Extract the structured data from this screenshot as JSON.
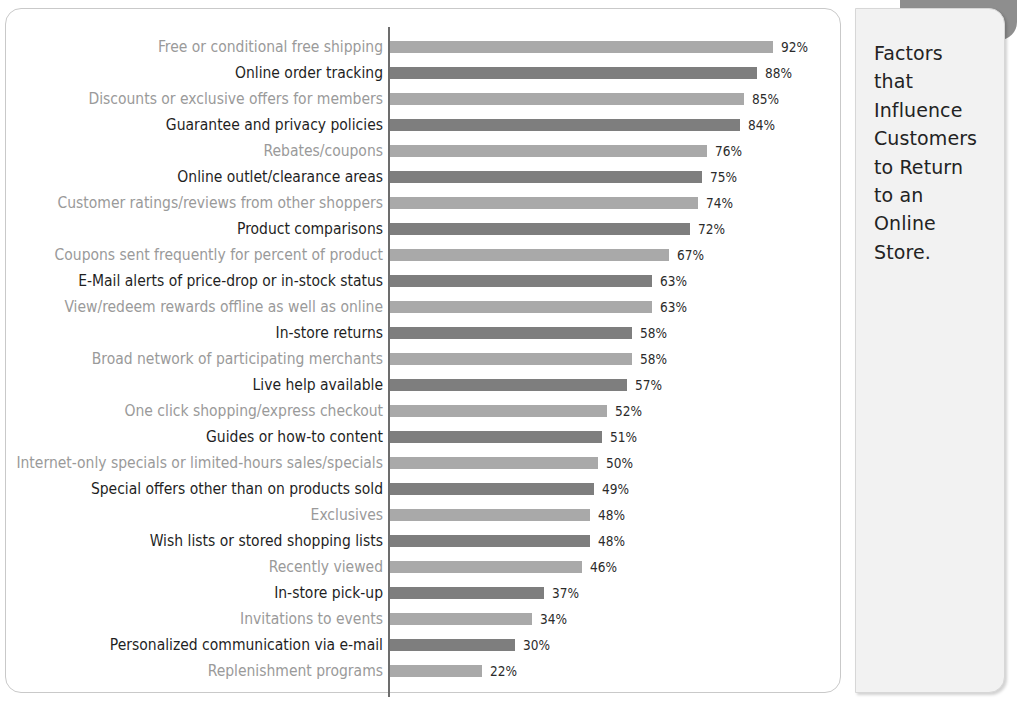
{
  "panel": {
    "title": "Factors that Influence Customers to Return to an Online Store.",
    "title_wrapped": "Factors\nthat\nInfluence\nCustomers\nto Return\nto an\nOnline\nStore."
  },
  "colors": {
    "bar_light": "#a9a9a9",
    "bar_dark": "#7e7e7e",
    "label_light": "#9a9a9a",
    "label_dark": "#1f1f1f",
    "value_label": "#2b2b2b",
    "axis": "#6d6d6d",
    "panel_bg": "#f2f2f2",
    "card_bg": "#ffffff",
    "shadow_band": "#8e8e8e"
  },
  "chart_data": {
    "type": "bar",
    "orientation": "horizontal",
    "title": "Factors that Influence Customers to Return to an Online Store.",
    "xlabel": "",
    "ylabel": "",
    "xlim": [
      0,
      100
    ],
    "grid": false,
    "legend": "none",
    "value_suffix": "%",
    "categories": [
      "Free or conditional free shipping",
      "Online order tracking",
      "Discounts or exclusive offers for members",
      "Guarantee and privacy policies",
      "Rebates/coupons",
      "Online outlet/clearance areas",
      "Customer ratings/reviews from other shoppers",
      "Product comparisons",
      "Coupons sent frequently for percent of product",
      "E-Mail alerts of price-drop or in-stock status",
      "View/redeem rewards offline as well as online",
      "In-store returns",
      "Broad network of participating merchants",
      "Live help available",
      "One click shopping/express checkout",
      "Guides or how-to content",
      "Internet-only specials or limited-hours sales/specials",
      "Special offers other than on products sold",
      "Exclusives",
      "Wish lists or stored shopping lists",
      "Recently viewed",
      "In-store pick-up",
      "Invitations to events",
      "Personalized communication via e-mail",
      "Replenishment programs"
    ],
    "values": [
      92,
      88,
      85,
      84,
      76,
      75,
      74,
      72,
      67,
      63,
      63,
      58,
      58,
      57,
      52,
      51,
      50,
      49,
      48,
      48,
      46,
      37,
      34,
      30,
      22
    ],
    "value_labels": [
      "92%",
      "88%",
      "85%",
      "84%",
      "76%",
      "75%",
      "74%",
      "72%",
      "67%",
      "63%",
      "63%",
      "58%",
      "58%",
      "57%",
      "52%",
      "51%",
      "50%",
      "49%",
      "48%",
      "48%",
      "46%",
      "37%",
      "34%",
      "30%",
      "22%"
    ],
    "bar_styles": [
      "light",
      "dark",
      "light",
      "dark",
      "light",
      "dark",
      "light",
      "dark",
      "light",
      "dark",
      "light",
      "dark",
      "light",
      "dark",
      "light",
      "dark",
      "light",
      "dark",
      "light",
      "dark",
      "light",
      "dark",
      "light",
      "dark",
      "light"
    ],
    "label_styles": [
      "light",
      "dark",
      "light",
      "dark",
      "light",
      "dark",
      "light",
      "dark",
      "light",
      "dark",
      "light",
      "dark",
      "light",
      "dark",
      "light",
      "dark",
      "light",
      "dark",
      "light",
      "dark",
      "light",
      "dark",
      "light",
      "dark",
      "light"
    ]
  }
}
